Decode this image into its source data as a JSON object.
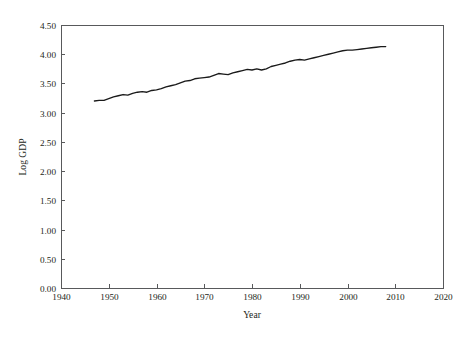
{
  "figure": {
    "background_color": "#ffffff",
    "frame_color": "#58595b",
    "line_color": "#1a1a1a",
    "text_color": "#231f20"
  },
  "axes": {
    "x_title": "Year",
    "y_title": "Log GDP",
    "x_ticks": [
      "1940",
      "1950",
      "1960",
      "1970",
      "1980",
      "1990",
      "2000",
      "2010",
      "2020"
    ],
    "y_ticks": [
      "0.00",
      "0.50",
      "1.00",
      "1.50",
      "2.00",
      "2.50",
      "3.00",
      "3.50",
      "4.00",
      "4.50"
    ]
  },
  "chart_data": {
    "type": "line",
    "title": "",
    "subtitle": "",
    "xlabel": "Year",
    "ylabel": "Log GDP",
    "xlim": [
      1940,
      2020
    ],
    "ylim": [
      0.0,
      4.5
    ],
    "xticks": [
      1940,
      1950,
      1960,
      1970,
      1980,
      1990,
      2000,
      2010,
      2020
    ],
    "yticks": [
      0.0,
      0.5,
      1.0,
      1.5,
      2.0,
      2.5,
      3.0,
      3.5,
      4.0,
      4.5
    ],
    "grid": false,
    "legend": false,
    "legend_position": "none",
    "annotations": [],
    "series": [
      {
        "name": "Log GDP",
        "color": "#1a1a1a",
        "x": [
          1947,
          1948,
          1949,
          1950,
          1951,
          1952,
          1953,
          1954,
          1955,
          1956,
          1957,
          1958,
          1959,
          1960,
          1961,
          1962,
          1963,
          1964,
          1965,
          1966,
          1967,
          1968,
          1969,
          1970,
          1971,
          1972,
          1973,
          1974,
          1975,
          1976,
          1977,
          1978,
          1979,
          1980,
          1981,
          1982,
          1983,
          1984,
          1985,
          1986,
          1987,
          1988,
          1989,
          1990,
          1991,
          1992,
          1993,
          1994,
          1995,
          1996,
          1997,
          1998,
          1999,
          2000,
          2001,
          2002,
          2003,
          2004,
          2005,
          2006,
          2007,
          2008
        ],
        "y": [
          3.2,
          3.21,
          3.21,
          3.24,
          3.27,
          3.29,
          3.31,
          3.3,
          3.33,
          3.35,
          3.36,
          3.35,
          3.38,
          3.39,
          3.41,
          3.44,
          3.46,
          3.48,
          3.51,
          3.54,
          3.55,
          3.58,
          3.59,
          3.6,
          3.61,
          3.64,
          3.67,
          3.66,
          3.65,
          3.68,
          3.7,
          3.72,
          3.74,
          3.73,
          3.75,
          3.73,
          3.75,
          3.79,
          3.81,
          3.83,
          3.85,
          3.88,
          3.9,
          3.91,
          3.9,
          3.92,
          3.94,
          3.96,
          3.98,
          4.0,
          4.02,
          4.04,
          4.06,
          4.07,
          4.07,
          4.08,
          4.09,
          4.1,
          4.11,
          4.12,
          4.13,
          4.13
        ]
      }
    ]
  },
  "geometry": {
    "plot_left": 61,
    "plot_right": 443,
    "plot_top": 25,
    "plot_bottom": 288
  }
}
